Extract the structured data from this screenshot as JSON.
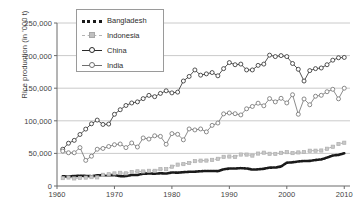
{
  "chart_data": {
    "type": "line",
    "title": "",
    "xlabel": "",
    "ylabel": "Rice production (in '000 t)",
    "xlim": [
      1960,
      2011
    ],
    "ylim": [
      0,
      250000
    ],
    "ytick_labels": [
      "0",
      "50,000",
      "100,000",
      "150,000",
      "200,000",
      "250,000"
    ],
    "ytick_values": [
      0,
      50000,
      100000,
      150000,
      200000,
      250000
    ],
    "xtick_labels": [
      "1960",
      "1970",
      "1980",
      "1990",
      "2000",
      "2010"
    ],
    "xtick_values": [
      1960,
      1970,
      1980,
      1990,
      2000,
      2010
    ],
    "grid": "horizontal",
    "legend_position": "top-left-inside",
    "x": [
      1961,
      1962,
      1963,
      1964,
      1965,
      1966,
      1967,
      1968,
      1969,
      1970,
      1971,
      1972,
      1973,
      1974,
      1975,
      1976,
      1977,
      1978,
      1979,
      1980,
      1981,
      1982,
      1983,
      1984,
      1985,
      1986,
      1987,
      1988,
      1989,
      1990,
      1991,
      1992,
      1993,
      1994,
      1995,
      1996,
      1997,
      1998,
      1999,
      2000,
      2001,
      2002,
      2003,
      2004,
      2005,
      2006,
      2007,
      2008,
      2009,
      2010
    ],
    "series": [
      {
        "name": "Bangladesh",
        "marker": "none",
        "color": "#1a1a1a",
        "style": "thick-dotted",
        "values": [
          14800,
          14500,
          15300,
          15700,
          15400,
          15000,
          16400,
          16700,
          16400,
          16800,
          15000,
          15200,
          16900,
          16800,
          18900,
          19100,
          19000,
          19500,
          19100,
          20800,
          20400,
          21200,
          21800,
          22000,
          22600,
          23100,
          23100,
          22800,
          25500,
          26800,
          26900,
          27400,
          26900,
          25200,
          25500,
          26400,
          28200,
          28300,
          29900,
          35800,
          36300,
          37600,
          38300,
          38500,
          39800,
          40800,
          43500,
          46700,
          47700,
          50100
        ]
      },
      {
        "name": "Indonesia",
        "marker": "square",
        "color": "#b4b4b4",
        "style": "dashed",
        "values": [
          12100,
          13000,
          11600,
          12300,
          12900,
          13600,
          13200,
          17200,
          18000,
          19300,
          20200,
          19400,
          21500,
          22500,
          22300,
          23300,
          23300,
          25800,
          25800,
          29650,
          32770,
          33580,
          35300,
          38140,
          38900,
          39030,
          40080,
          41680,
          44730,
          45180,
          44690,
          48240,
          48180,
          46640,
          49740,
          51100,
          49380,
          49240,
          50870,
          51900,
          50460,
          51490,
          52140,
          54090,
          54150,
          54450,
          57160,
          60250,
          64400,
          66410
        ]
      },
      {
        "name": "China",
        "marker": "circle-open",
        "color": "#2a2a2a",
        "style": "solid",
        "values": [
          56400,
          65600,
          70000,
          79000,
          87300,
          95400,
          101100,
          94400,
          95000,
          109990,
          117000,
          123500,
          127350,
          129000,
          134000,
          139000,
          137000,
          142000,
          146000,
          142800,
          144000,
          161000,
          168000,
          178000,
          170000,
          172000,
          174000,
          169000,
          180000,
          189300,
          186000,
          187000,
          178000,
          178000,
          185000,
          187000,
          200700,
          198500,
          200000,
          198500,
          187900,
          179000,
          161000,
          177000,
          180000,
          181000,
          186000,
          193000,
          196700,
          197200
        ]
      },
      {
        "name": "India",
        "marker": "circle-open",
        "color": "#6e6e6e",
        "style": "solid",
        "values": [
          53490,
          51000,
          51000,
          58900,
          39300,
          45700,
          56400,
          57600,
          60600,
          63340,
          64400,
          58900,
          66000,
          59800,
          73700,
          72000,
          77000,
          76100,
          64000,
          80310,
          79300,
          70800,
          87500,
          86000,
          87500,
          83000,
          93000,
          96600,
          110600,
          112000,
          110900,
          109000,
          118400,
          122000,
          127000,
          123000,
          134000,
          129000,
          134500,
          127400,
          140000,
          110000,
          133500,
          124600,
          137700,
          139100,
          144600,
          148300,
          133700,
          150000
        ]
      }
    ]
  },
  "legend": {
    "items": [
      {
        "label": "Bangladesh"
      },
      {
        "label": "Indonesia"
      },
      {
        "label": "China"
      },
      {
        "label": "India"
      }
    ]
  }
}
